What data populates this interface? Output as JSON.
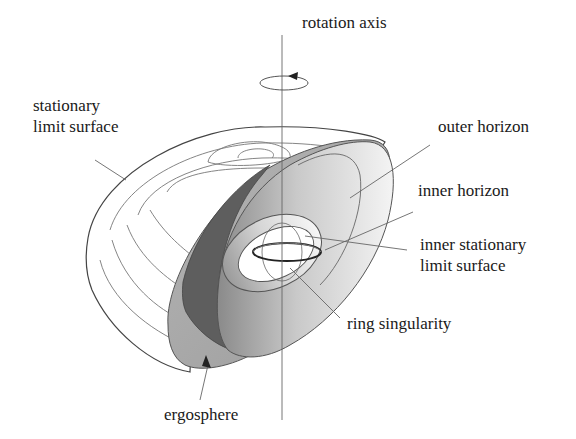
{
  "labels": {
    "rotation_axis": "rotation axis",
    "stationary_limit_surface": "stationary\nlimit surface",
    "outer_horizon": "outer horizon",
    "inner_horizon": "inner horizon",
    "inner_stationary_limit_surface": "inner stationary\nlimit surface",
    "ring_singularity": "ring singularity",
    "ergosphere": "ergosphere"
  },
  "colors": {
    "line": "#555555",
    "text": "#1a1a1a",
    "ergosphere_dark": "#5e5e5e",
    "ergosphere_mid": "#a8a8a8",
    "horizon_light": "#f0f0f0",
    "ring": "#222222"
  }
}
